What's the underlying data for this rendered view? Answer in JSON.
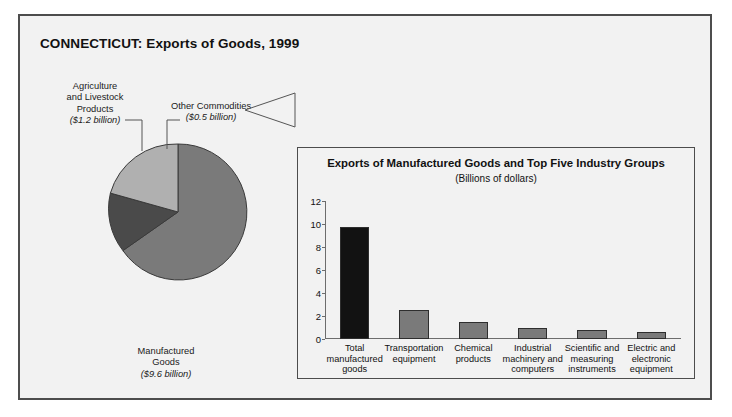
{
  "figure": {
    "title": "CONNECTICUT: Exports of Goods, 1999"
  },
  "pie_callouts": {
    "agriculture": {
      "label": "Agriculture and Livestock Products",
      "line1": "Agriculture",
      "line2": "and Livestock",
      "line3": "Products",
      "amount": "($1.2 billion)"
    },
    "other": {
      "label": "Other Commodities",
      "line1": "Other Commodities",
      "amount": "($0.5 billion)"
    },
    "manufactured": {
      "label": "Manufactured Goods",
      "line1": "Manufactured",
      "line2": "Goods",
      "amount": "($9.6 billion)"
    }
  },
  "panel": {
    "title": "Exports of Manufactured Goods and Top Five Industry Groups",
    "subtitle": "(Billions of dollars)"
  },
  "colors": {
    "frame_border": "#4d4d4d",
    "figure_bg": "#f2f2f2",
    "pie_manufactured": "#7a7a7a",
    "pie_agriculture": "#4a4a4a",
    "pie_other": "#b0b0b0",
    "bar_total": "#121212",
    "bar_industry": "#7a7a7a",
    "axis": "#6d6d6d"
  },
  "chart_data": [
    {
      "type": "pie",
      "title": "CONNECTICUT: Exports of Goods, 1999",
      "unit": "billions of dollars",
      "categories": [
        "Manufactured Goods",
        "Agriculture and Livestock Products",
        "Other Commodities"
      ],
      "values": [
        9.6,
        1.2,
        0.5
      ],
      "value_labels": [
        "($9.6 billion)",
        "($1.2 billion)",
        "($0.5 billion)"
      ],
      "colors": [
        "#7a7a7a",
        "#4a4a4a",
        "#b0b0b0"
      ],
      "legend": "callout labels",
      "total": 11.3
    },
    {
      "type": "bar",
      "title": "Exports of Manufactured Goods and Top Five Industry Groups",
      "subtitle": "(Billions of dollars)",
      "xlabel": "",
      "ylabel": "",
      "ylim": [
        0,
        12
      ],
      "yticks": [
        0,
        2,
        4,
        6,
        8,
        10,
        12
      ],
      "grid": false,
      "categories": [
        "Total manufactured goods",
        "Transportation equipment",
        "Chemical products",
        "Industrial machinery and computers",
        "Scientific and measuring instruments",
        "Electric and electronic equipment"
      ],
      "category_lines": [
        [
          "Total",
          "manufactured",
          "goods"
        ],
        [
          "Transportation",
          "equipment"
        ],
        [
          "Chemical",
          "products"
        ],
        [
          "Industrial",
          "machinery and",
          "computers"
        ],
        [
          "Scientific and",
          "measuring",
          "instruments"
        ],
        [
          "Electric and",
          "electronic",
          "equipment"
        ]
      ],
      "values": [
        9.7,
        2.5,
        1.5,
        1.0,
        0.75,
        0.6
      ],
      "bar_colors": [
        "#121212",
        "#7a7a7a",
        "#7a7a7a",
        "#7a7a7a",
        "#7a7a7a",
        "#7a7a7a"
      ]
    }
  ]
}
